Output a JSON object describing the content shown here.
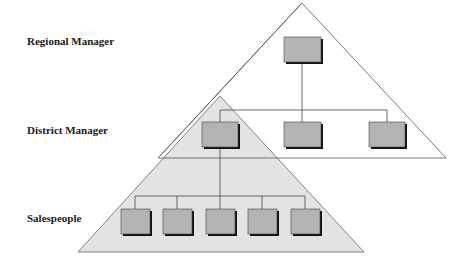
{
  "diagram": {
    "type": "organizational-hierarchy",
    "levels": [
      {
        "id": "regional",
        "label": "Regional Manager",
        "count": 1
      },
      {
        "id": "district",
        "label": "District Manager",
        "count": 3
      },
      {
        "id": "sales",
        "label": "Salespeople",
        "count": 5
      }
    ],
    "colors": {
      "box_fill": "#b3b3b3",
      "box_shadow": "#111111",
      "small_triangle_fill": "#e3e3e3",
      "big_triangle_fill": "#ffffff",
      "line": "#555555"
    }
  }
}
